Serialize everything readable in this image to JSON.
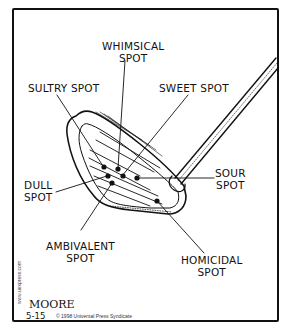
{
  "cartoon": {
    "labels": {
      "whimsical": "WHIMSICAL\nSPOT",
      "sultry": "SULTRY SPOT",
      "sweet": "SWEET SPOT",
      "sour": "SOUR\nSPOT",
      "dull": "DULL\nSPOT",
      "ambivalent": "AMBIVALENT\nSPOT",
      "homicidal": "HOMICIDAL\nSPOT"
    },
    "signature": "MOORE",
    "date": "5-15",
    "copyright": "© 1998 Universal Press Syndicate",
    "website": "www.uexpress.com"
  },
  "colors": {
    "ink": "#111111",
    "paper": "#ffffff"
  }
}
